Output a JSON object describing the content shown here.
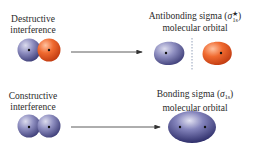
{
  "colors": {
    "background": "#ffffff",
    "blue_lobe": "#5e5e96",
    "blue_lobe_highlight": "#d8d8ec",
    "orange_lobe": "#e2501e",
    "orange_lobe_highlight": "#ffb490",
    "arrow": "#333333",
    "node_line": "#7a8aa8",
    "text": "#2a2a2a"
  },
  "top_row": {
    "left_label": {
      "line1": "Destructive",
      "line2": "interference"
    },
    "right_label": {
      "line1_prefix": "Antibonding sigma (",
      "symbol": "σ",
      "superscript": "★",
      "subscript": "1s",
      "line1_suffix": ")",
      "line2": "molecular orbital"
    },
    "left_orbitals": [
      "blue 1s orbital",
      "orange 1s orbital (opposite phase)"
    ],
    "right_orbitals": [
      "blue lobe",
      "nodal plane",
      "orange lobe"
    ]
  },
  "bottom_row": {
    "left_label": {
      "line1": "Constructive",
      "line2": "interference"
    },
    "right_label": {
      "line1_prefix": "Bonding sigma (",
      "symbol": "σ",
      "subscript": "1s",
      "line1_suffix": ")",
      "line2": "molecular orbital"
    },
    "left_orbitals": [
      "blue 1s orbital",
      "blue 1s orbital (same phase)"
    ],
    "right_orbitals": [
      "single bonding ellipsoid with two nuclei"
    ]
  }
}
